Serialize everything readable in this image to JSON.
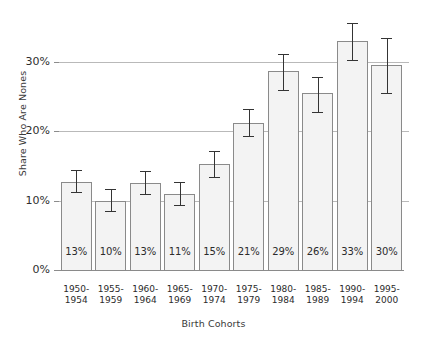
{
  "chart_data": {
    "type": "bar",
    "title": "",
    "xlabel": "Birth Cohorts",
    "ylabel": "Share Who Are Nones",
    "categories": [
      "1950-\n1954",
      "1955-\n1959",
      "1960-\n1964",
      "1965-\n1969",
      "1970-\n1974",
      "1975-\n1979",
      "1980-\n1984",
      "1985-\n1989",
      "1990-\n1994",
      "1995-\n2000"
    ],
    "category_lines": [
      [
        "1950-",
        "1954"
      ],
      [
        "1955-",
        "1959"
      ],
      [
        "1960-",
        "1964"
      ],
      [
        "1965-",
        "1969"
      ],
      [
        "1970-",
        "1974"
      ],
      [
        "1975-",
        "1979"
      ],
      [
        "1980-",
        "1984"
      ],
      [
        "1985-",
        "1989"
      ],
      [
        "1990-",
        "1994"
      ],
      [
        "1995-",
        "2000"
      ]
    ],
    "values": [
      12.7,
      10.0,
      12.6,
      11.0,
      15.3,
      21.2,
      28.7,
      25.6,
      33.0,
      29.6
    ],
    "data_labels": [
      "13%",
      "10%",
      "13%",
      "11%",
      "15%",
      "21%",
      "29%",
      "26%",
      "33%",
      "30%"
    ],
    "err_low": [
      11.2,
      8.5,
      11.0,
      9.4,
      13.4,
      19.3,
      26.0,
      22.8,
      30.3,
      25.5
    ],
    "err_high": [
      14.4,
      11.7,
      14.3,
      12.7,
      17.2,
      23.3,
      31.2,
      27.8,
      35.6,
      33.5
    ],
    "ylim": [
      0,
      36
    ],
    "yticks": [
      0,
      10,
      20,
      30
    ],
    "ytick_labels": [
      "0%",
      "10%",
      "20%",
      "30%"
    ],
    "grid": true,
    "legend": "none",
    "colors": {
      "bar_fill": "#f3f3f3",
      "bar_border": "#8a8a8a",
      "error_bar": "#343434",
      "gridline": "#b9b9b9",
      "axis_text": "#2b2b2b"
    }
  }
}
